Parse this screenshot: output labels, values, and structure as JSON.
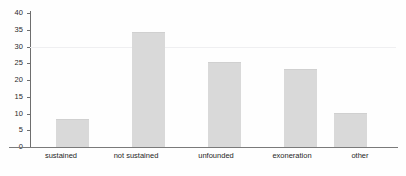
{
  "chart_data": {
    "type": "bar",
    "title": "",
    "subtitle": "",
    "xlabel": "",
    "ylabel": "",
    "categories": [
      "sustained",
      "not sustained",
      "unfounded",
      "exoneration",
      "other"
    ],
    "values": [
      8,
      34,
      25,
      23,
      10
    ],
    "series": [
      {
        "name": "count",
        "values": [
          8,
          34,
          25,
          23,
          10
        ]
      }
    ],
    "ylim": [
      0,
      40
    ],
    "yticks": [
      0,
      5,
      10,
      15,
      20,
      25,
      30,
      35,
      40
    ],
    "ytick_labels": [
      "0",
      "5",
      "10",
      "15",
      "20",
      "25",
      "30",
      "35",
      "40"
    ],
    "grid": "faint horizontal line at 30",
    "legend": "none",
    "legend_position": "none",
    "bar_color": "#d9d9d9",
    "axis_color": "#6e6e6e",
    "gridline_color": "#efeff1",
    "text_color": "#1f1f1f",
    "background_color": "#fefefe"
  }
}
